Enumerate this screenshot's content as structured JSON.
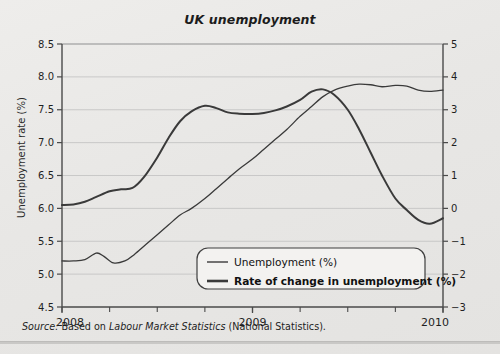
{
  "figure": {
    "title": "UK unemployment",
    "source_prefix": "Source:",
    "source_mid": " Based on ",
    "source_italic": "Labour Market Statistics",
    "source_suffix": " (National Statistics)."
  },
  "chart_data": {
    "type": "line",
    "title": "UK unemployment",
    "xlabel": "",
    "ylabel": "Unemployment rate (%)",
    "y2label": "Rate of change in unemployment (%)",
    "xlim": [
      2008.0,
      2010.0
    ],
    "ylim": [
      4.5,
      8.5
    ],
    "y2lim": [
      -3,
      5
    ],
    "grid": true,
    "legend_position": "bottom-center",
    "xticks_major": [
      "2008",
      "2009",
      "2010"
    ],
    "xtick_major_values": [
      2008,
      2009,
      2010
    ],
    "xtick_minor_count": 8,
    "yticks": [
      "4.5",
      "5.0",
      "5.5",
      "6.0",
      "6.5",
      "7.0",
      "7.5",
      "8.0",
      "8.5"
    ],
    "ytick_values": [
      4.5,
      5.0,
      5.5,
      6.0,
      6.5,
      7.0,
      7.5,
      8.0,
      8.5
    ],
    "y2ticks": [
      "-3",
      "-2",
      "-1",
      "0",
      "1",
      "2",
      "3",
      "4",
      "5"
    ],
    "y2tick_values": [
      -3,
      -2,
      -1,
      0,
      1,
      2,
      3,
      4,
      5
    ],
    "colors": {
      "line": "#3a3a3a",
      "grid": "#c0c0c0",
      "axis": "#555555"
    },
    "series": [
      {
        "name": "Unemployment (%)",
        "axis": "left",
        "linewidth": 1.3,
        "x": [
          2008.0,
          2008.06,
          2008.12,
          2008.18,
          2008.22,
          2008.27,
          2008.33,
          2008.38,
          2008.44,
          2008.5,
          2008.56,
          2008.62,
          2008.68,
          2008.75,
          2008.81,
          2008.87,
          2008.93,
          2009.0,
          2009.06,
          2009.12,
          2009.18,
          2009.25,
          2009.31,
          2009.37,
          2009.43,
          2009.5,
          2009.56,
          2009.62,
          2009.68,
          2009.75,
          2009.81,
          2009.87,
          2009.93,
          2010.0
        ],
        "values": [
          5.2,
          5.2,
          5.22,
          5.32,
          5.27,
          5.17,
          5.2,
          5.3,
          5.45,
          5.6,
          5.75,
          5.9,
          6.0,
          6.15,
          6.3,
          6.45,
          6.6,
          6.75,
          6.9,
          7.05,
          7.2,
          7.4,
          7.55,
          7.7,
          7.8,
          7.86,
          7.89,
          7.88,
          7.85,
          7.87,
          7.86,
          7.8,
          7.78,
          7.8
        ]
      },
      {
        "name": "Rate of change in unemployment (%)",
        "axis": "right",
        "linewidth": 2.0,
        "x": [
          2008.0,
          2008.06,
          2008.12,
          2008.18,
          2008.25,
          2008.31,
          2008.37,
          2008.43,
          2008.5,
          2008.56,
          2008.62,
          2008.68,
          2008.75,
          2008.81,
          2008.87,
          2008.93,
          2009.0,
          2009.06,
          2009.12,
          2009.18,
          2009.25,
          2009.31,
          2009.37,
          2009.43,
          2009.5,
          2009.56,
          2009.62,
          2009.68,
          2009.75,
          2009.81,
          2009.87,
          2009.93,
          2010.0
        ],
        "values": [
          0.1,
          0.12,
          0.2,
          0.35,
          0.52,
          0.58,
          0.62,
          0.95,
          1.55,
          2.15,
          2.65,
          2.95,
          3.12,
          3.05,
          2.92,
          2.88,
          2.87,
          2.9,
          2.98,
          3.1,
          3.3,
          3.55,
          3.62,
          3.45,
          3.0,
          2.4,
          1.7,
          1.0,
          0.3,
          -0.05,
          -0.35,
          -0.47,
          -0.3
        ]
      }
    ],
    "legend": [
      {
        "label": "Unemployment (%)",
        "bold": false,
        "linewidth": 1.4
      },
      {
        "label": "Rate of change in unemployment (%)",
        "bold": true,
        "linewidth": 2.6
      }
    ]
  }
}
